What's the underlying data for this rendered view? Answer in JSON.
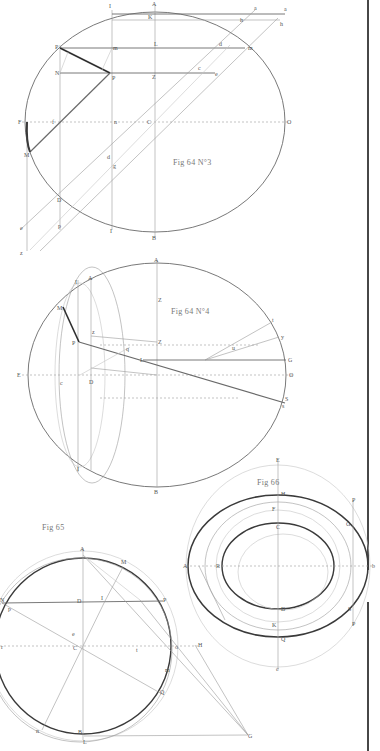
{
  "plate": {
    "background": "#ffffff",
    "ink_color": "#3a3a3a",
    "faint_color": "#c4c4c4"
  },
  "figures": [
    {
      "id": "fig64n3",
      "title": "Fig 64 N°3",
      "labels": {
        "A": "A",
        "I": "I",
        "K": "K",
        "a_small": "a",
        "a": "a",
        "h_small": "h",
        "h": "h",
        "P_top": "P",
        "m_top": "m",
        "L": "L",
        "d": "d",
        "m_right": "m",
        "N": "N",
        "P_mid": "P",
        "Z": "Z",
        "c": "c",
        "e": "e",
        "F": "F",
        "f": "f",
        "n": "n",
        "C": "C",
        "O": "O",
        "M": "M",
        "d_low": "d",
        "g": "g",
        "D": "D",
        "e_low": "e",
        "p": "p",
        "I_low": "I",
        "B": "B",
        "z": "z"
      }
    },
    {
      "id": "fig64n4",
      "title": "Fig 64 N°4",
      "labels": {
        "A": "A",
        "I": "I",
        "A2": "A",
        "Z_top": "Z",
        "M": "M",
        "z": "z",
        "P": "P",
        "Z_mid": "Z",
        "q": "q",
        "L": "L",
        "G": "G",
        "t": "t",
        "y": "y",
        "u": "u",
        "E": "E",
        "c": "c",
        "D": "D",
        "O": "O",
        "S": "S",
        "s": "s",
        "I_low": "I",
        "B": "B"
      }
    },
    {
      "id": "fig65",
      "title": "Fig 65",
      "labels": {
        "A": "A",
        "M": "M",
        "D": "D",
        "I": "I",
        "P": "P",
        "N": "N",
        "p": "p",
        "e": "e",
        "C": "C",
        "r": "r",
        "t": "t",
        "H": "H",
        "o": "o",
        "Q": "Q",
        "n": "n",
        "m": "m",
        "B": "B",
        "L": "L",
        "G": "G",
        "R": "R"
      }
    },
    {
      "id": "fig66",
      "title": "Fig 66",
      "labels": {
        "E": "E",
        "H": "H",
        "P_top": "P",
        "C": "C",
        "F": "F",
        "G": "G",
        "A": "A",
        "R": "R",
        "D": "D",
        "S": "S",
        "P_bot": "P",
        "K": "K",
        "Q": "Q",
        "c": "c",
        "b": "b"
      }
    }
  ]
}
